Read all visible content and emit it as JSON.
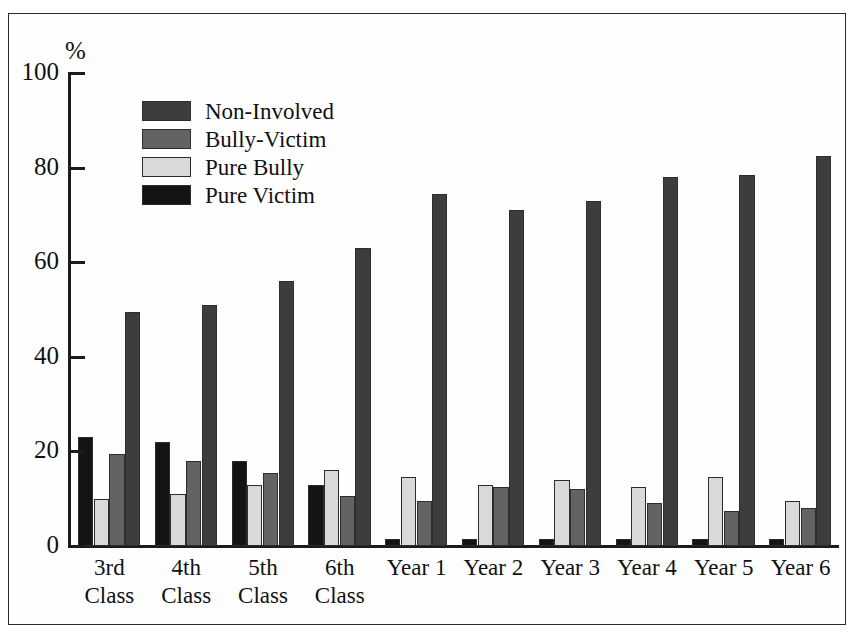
{
  "figure": {
    "axis_unit_label": "%",
    "frame_color": "#2a2a2a"
  },
  "legend": {
    "position": "top-left-inside",
    "entries": [
      {
        "label": "Non-Involved",
        "color": "#3d3d3d"
      },
      {
        "label": "Bully-Victim",
        "color": "#636363"
      },
      {
        "label": "Pure Bully",
        "color": "#d9d9d9"
      },
      {
        "label": "Pure Victim",
        "color": "#141414"
      }
    ]
  },
  "yaxis": {
    "ticks": [
      0,
      20,
      40,
      60,
      80,
      100
    ],
    "tick_labels": [
      "0",
      "20",
      "40",
      "60",
      "80",
      "100"
    ],
    "min": 0,
    "max": 100,
    "unit": "%"
  },
  "chart_data": {
    "type": "bar",
    "title": "",
    "subtitle": "",
    "xlabel": "",
    "ylabel": "%",
    "ylim": [
      0,
      100
    ],
    "grid": false,
    "legend_position": "top-left-inside",
    "bar_order_in_group": [
      "Pure Victim",
      "Pure Bully",
      "Bully-Victim",
      "Non-Involved"
    ],
    "categories": [
      "3rd Class",
      "4th Class",
      "5th Class",
      "6th Class",
      "Year 1",
      "Year 2",
      "Year 3",
      "Year 4",
      "Year 5",
      "Year 6"
    ],
    "category_lines": [
      [
        "3rd",
        "Class"
      ],
      [
        "4th",
        "Class"
      ],
      [
        "5th",
        "Class"
      ],
      [
        "6th",
        "Class"
      ],
      [
        "Year 1",
        ""
      ],
      [
        "Year 2",
        ""
      ],
      [
        "Year 3",
        ""
      ],
      [
        "Year 4",
        ""
      ],
      [
        "Year 5",
        ""
      ],
      [
        "Year 6",
        ""
      ]
    ],
    "series": [
      {
        "name": "Pure Victim",
        "color": "#141414",
        "values": [
          23,
          22,
          18,
          13,
          1.5,
          1.5,
          1.5,
          1.5,
          1.5,
          1.5
        ]
      },
      {
        "name": "Pure Bully",
        "color": "#d9d9d9",
        "values": [
          10,
          11,
          13,
          16,
          14.5,
          13,
          14,
          12.5,
          14.5,
          9.5
        ]
      },
      {
        "name": "Bully-Victim",
        "color": "#636363",
        "values": [
          19.5,
          18,
          15.5,
          10.5,
          9.5,
          12.5,
          12,
          9,
          7.5,
          8
        ]
      },
      {
        "name": "Non-Involved",
        "color": "#3d3d3d",
        "values": [
          49.5,
          51,
          56,
          63,
          74.5,
          71,
          73,
          78,
          78.5,
          82.5
        ]
      }
    ],
    "note": "Bars within each category are drawn left-to-right in bar_order_in_group; series values are aligned to categories."
  }
}
